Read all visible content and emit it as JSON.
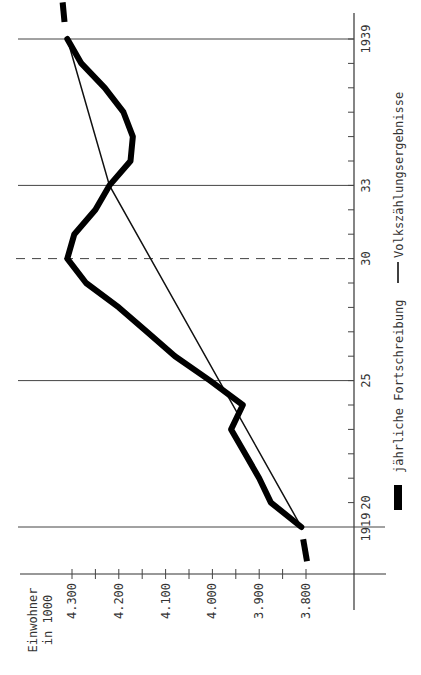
{
  "chart_data": {
    "type": "line",
    "orientation": "rotated-90-ccw",
    "title": "",
    "xlabel": "",
    "ylabel": "Einwohner in 1000",
    "ylabel_lines": [
      "Einwohner",
      "in 1000"
    ],
    "x_ticks_major": [
      {
        "value": 1919,
        "label": "1919"
      },
      {
        "value": 1920,
        "label": "20"
      },
      {
        "value": 1925,
        "label": "25"
      },
      {
        "value": 1930,
        "label": "30"
      },
      {
        "value": 1933,
        "label": "33"
      },
      {
        "value": 1939,
        "label": "1939"
      }
    ],
    "x_range": [
      1917,
      1940
    ],
    "y_ticks": [
      {
        "value": 3800,
        "label": "3.800"
      },
      {
        "value": 3900,
        "label": "3.900"
      },
      {
        "value": 4000,
        "label": "4.000"
      },
      {
        "value": 4100,
        "label": "4.100"
      },
      {
        "value": 4200,
        "label": "4.200"
      },
      {
        "value": 4300,
        "label": "4.300"
      }
    ],
    "ylim": [
      3750,
      4350
    ],
    "reference_lines": [
      {
        "year": 1919,
        "style": "solid"
      },
      {
        "year": 1925,
        "style": "solid"
      },
      {
        "year": 1930,
        "style": "dashed"
      },
      {
        "year": 1933,
        "style": "solid"
      },
      {
        "year": 1939,
        "style": "solid"
      }
    ],
    "series": [
      {
        "name": "jährliche Fortschreibung",
        "style": "thick",
        "x": [
          1919,
          1920,
          1921,
          1922,
          1923,
          1924,
          1925,
          1926,
          1927,
          1928,
          1929,
          1930,
          1931,
          1932,
          1933,
          1934,
          1935,
          1936,
          1937,
          1938,
          1939
        ],
        "values": [
          3810,
          3875,
          3900,
          3930,
          3960,
          3935,
          4005,
          4080,
          4140,
          4200,
          4270,
          4310,
          4295,
          4250,
          4220,
          4175,
          4170,
          4190,
          4230,
          4280,
          4310
        ],
        "extension_before": {
          "x": 1917.6,
          "value": 3800
        },
        "extension_after": {
          "x": 1940.5,
          "value": 4320
        }
      },
      {
        "name": "Volkszählungsergebnisse",
        "style": "thin",
        "x": [
          1919,
          1933,
          1939
        ],
        "values": [
          3810,
          4220,
          4310
        ]
      }
    ],
    "legend": [
      {
        "label": "jährliche Fortschreibung",
        "marker": "thick-bar"
      },
      {
        "label": "Volkszählungsergebnisse",
        "marker": "thin-line"
      }
    ],
    "legend_position": "right (rotated)",
    "grid": false
  }
}
